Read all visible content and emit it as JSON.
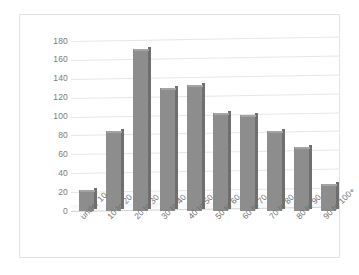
{
  "chart_data": {
    "type": "bar",
    "title": "",
    "subtitle": "",
    "xlabel": "",
    "ylabel": "",
    "categories": [
      "under 10",
      "10 to 20",
      "20 to 30",
      "30 to 40",
      "40 to 50",
      "50 to 60",
      "60 to 70",
      "70 to 80",
      "80 to 90",
      "90 to 100+"
    ],
    "values": [
      22,
      85,
      172,
      130,
      133,
      104,
      102,
      85,
      68,
      29
    ],
    "ylim": [
      0,
      180
    ],
    "y_ticks": [
      0,
      20,
      40,
      60,
      80,
      100,
      120,
      140,
      160,
      180
    ],
    "y_tick_labels": [
      "0",
      "20",
      "40",
      "60",
      "80",
      "100",
      "120",
      "140",
      "160",
      "180"
    ],
    "grid": true,
    "legend": "none",
    "series": [
      {
        "name": "",
        "values": [
          22,
          85,
          172,
          130,
          133,
          104,
          102,
          85,
          68,
          29
        ]
      }
    ],
    "style": {
      "bar_color": "#8d8d8d",
      "bar_side_color": "#6f6f6f",
      "bar_top_color": "#a4a4a4",
      "gridline_color": "#e6e6e6",
      "tick_label_color": "#6f6f6f",
      "plot_background": "#ffffff",
      "frame_border_color": "#e2e2e2"
    }
  }
}
